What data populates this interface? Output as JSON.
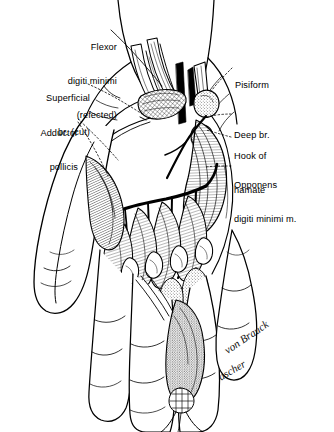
{
  "figure": {
    "background_color": "#ffffff",
    "ink_color": "#000000",
    "width": 334,
    "height": 432
  },
  "labels": [
    {
      "id": "flexor-digiti-minimi",
      "lines": [
        "Flexor",
        "digiti minimi",
        "(refected)"
      ],
      "text": "Flexor digiti minimi (refected)",
      "align": "right",
      "x": 25,
      "y": 22,
      "leader": "solid"
    },
    {
      "id": "superficial-br-cut",
      "lines": [
        "Superficial",
        "br. (cut)"
      ],
      "text": "Superficial br. (cut)",
      "align": "right",
      "x": 16,
      "y": 73,
      "leader": "dotted"
    },
    {
      "id": "adductor-pollicis",
      "lines": [
        "Adductor",
        "pollicis"
      ],
      "text": "Adductor pollicis",
      "align": "right",
      "x": 14,
      "y": 108,
      "leader": "dotted"
    },
    {
      "id": "pisiform",
      "lines": [
        "Pisiform"
      ],
      "text": "Pisiform",
      "align": "left",
      "x": 235,
      "y": 62,
      "leader": "dotted"
    },
    {
      "id": "deep-br",
      "lines": [
        "Deep br."
      ],
      "text": "Deep br.",
      "align": "left",
      "x": 234,
      "y": 110,
      "leader": "dotted"
    },
    {
      "id": "hook-of-hamate",
      "lines": [
        "Hook of",
        "hamate"
      ],
      "text": "Hook of hamate",
      "align": "left",
      "x": 234,
      "y": 131,
      "leader": "dotted"
    },
    {
      "id": "opponens-digiti-minimi",
      "lines": [
        "Opponens",
        "digiti minimi m."
      ],
      "text": "Opponens digiti minimi m.",
      "align": "left",
      "x": 234,
      "y": 160,
      "leader": "dotted"
    }
  ],
  "signature": {
    "line1": "von Brauck",
    "line2": "ascher",
    "x": 222,
    "y": 348
  }
}
